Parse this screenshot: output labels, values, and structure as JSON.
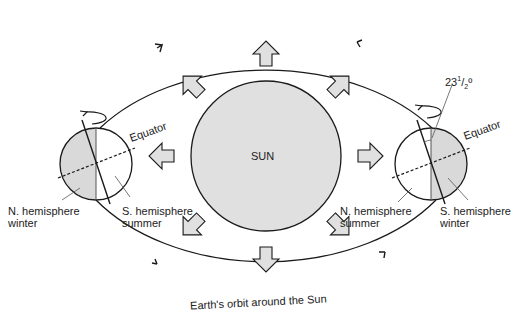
{
  "diagram": {
    "title": "Earth's orbit around the Sun",
    "sun_label": "SUN",
    "orbit_label": "Earth's orbit around the Sun",
    "left_earth": {
      "equator_label": "Equator",
      "north_label_line1": "N. hemisphere",
      "north_label_line2": "winter",
      "south_label_line1": "S. hemisphere",
      "south_label_line2": "summer"
    },
    "right_earth": {
      "tilt_label_main": "23",
      "tilt_label_frac_num": "1",
      "tilt_label_frac_den": "2",
      "tilt_label_deg": "º",
      "equator_label": "Equator",
      "north_label_line1": "N. hemisphere",
      "north_label_line2": "summer",
      "south_label_line1": "S. hemisphere",
      "south_label_line2": "winter"
    },
    "colors": {
      "shade": "#d9d9d9",
      "sun_fill": "#e0e0e0",
      "line": "#1a1a1a"
    }
  }
}
